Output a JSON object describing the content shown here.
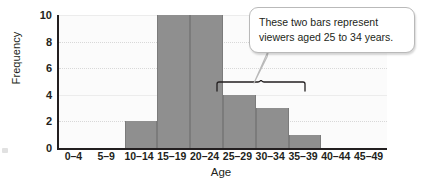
{
  "chart_data": {
    "type": "bar",
    "title": "",
    "subtitle": "",
    "xlabel": "Age",
    "ylabel": "Frequency",
    "categories": [
      "0–4",
      "5–9",
      "10–14",
      "15–19",
      "20–24",
      "25–29",
      "30–34",
      "35–39",
      "40–44",
      "45–49"
    ],
    "values": [
      0,
      0,
      2,
      10,
      10,
      4,
      3,
      1,
      0,
      0
    ],
    "ylim": [
      0,
      10
    ],
    "yticks": [
      0,
      2,
      4,
      6,
      8,
      10
    ],
    "ytick_labels": [
      "0",
      "2",
      "4",
      "6",
      "8",
      "10"
    ],
    "grid": true,
    "grid_axis": "y",
    "legend": false,
    "legend_position": "none",
    "bar_color": "#8f8f8f",
    "bar_edge_color": "#7b7b7b",
    "plot_background": "#fbfbfb",
    "axis_color": "#231f20",
    "gridline_color": "#d8d8d8"
  },
  "annotations": {
    "callout": {
      "text": "These two bars represent viewers aged 25 to 34 years.",
      "line1": "These two bars represent",
      "line2": "viewers aged 25 to 34 years.",
      "background": "#ffffff",
      "border_color": "#b9b9b9",
      "points_to": [
        "25–29",
        "30–34"
      ]
    },
    "brace": {
      "label": "",
      "spans": [
        "25–29",
        "30–34"
      ],
      "color": "#231f20"
    }
  }
}
